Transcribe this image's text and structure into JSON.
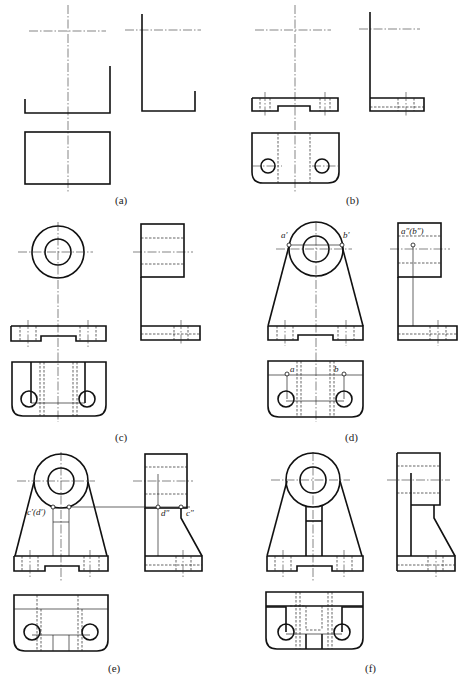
{
  "figure": {
    "captions": [
      "(a)",
      "(b)",
      "(c)",
      "(d)",
      "(e)",
      "(f)"
    ],
    "point_labels": {
      "d_a_prime": "a′",
      "d_b_prime": "b′",
      "d_ab_double": "a″(b″)",
      "d_a": "a",
      "d_b": "b",
      "e_cd_prime": "c′(d′)",
      "e_d_double": "d″",
      "e_c_double": "c″"
    }
  }
}
